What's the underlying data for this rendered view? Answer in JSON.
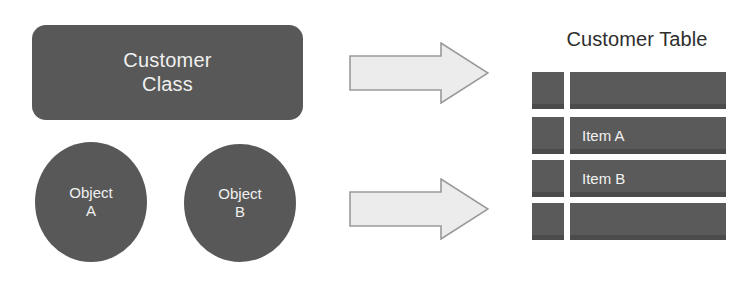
{
  "diagram": {
    "type": "object-relational-mapping",
    "colors": {
      "shape_fill": "#585858",
      "shape_text": "#f0f0f0",
      "table_cell_fill": "#5a5a5a",
      "table_cell_text": "#f2f2f2",
      "title_text": "#2e2e2e",
      "arrow_fill": "#ececec",
      "arrow_stroke": "#9a9a9a",
      "background": "#ffffff"
    }
  },
  "class_box": {
    "label": "Customer\nClass"
  },
  "objects": [
    {
      "id": "a",
      "label": "Object\nA"
    },
    {
      "id": "b",
      "label": "Object\nB"
    }
  ],
  "arrows": [
    {
      "id": "top",
      "direction": "right",
      "label": ""
    },
    {
      "id": "bottom",
      "direction": "right",
      "label": ""
    }
  ],
  "table": {
    "title": "Customer Table",
    "rows": [
      {
        "key": "",
        "value": ""
      },
      {
        "key": "",
        "value": "Item A"
      },
      {
        "key": "",
        "value": "Item B"
      },
      {
        "key": "",
        "value": ""
      }
    ]
  }
}
